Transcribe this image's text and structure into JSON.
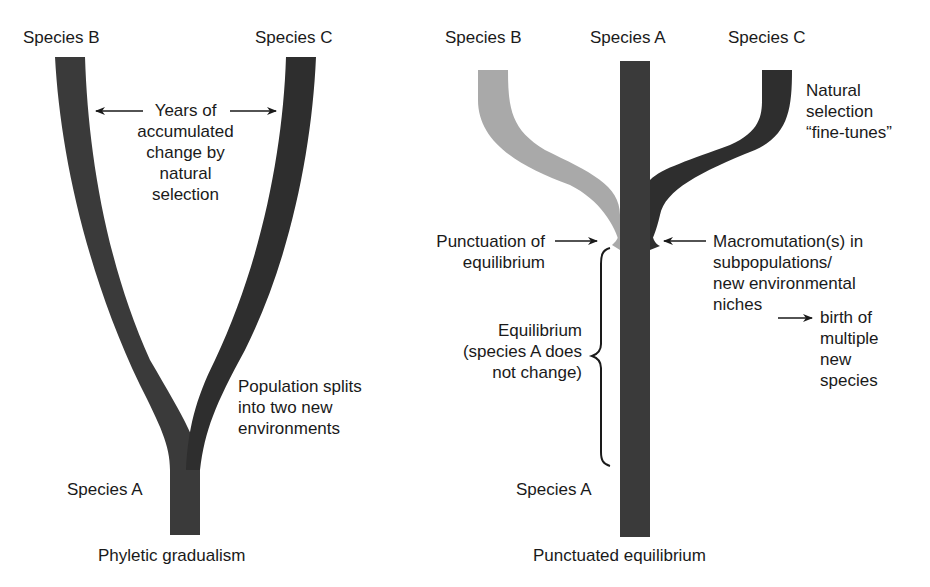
{
  "colors": {
    "dark_branch": "#3a3a3a",
    "darker_branch": "#2e2e2e",
    "light_branch": "#a9a9a9",
    "text": "#1a1a1a",
    "background": "#ffffff"
  },
  "left_panel": {
    "title": "Phyletic gradualism",
    "species_b": "Species B",
    "species_c": "Species C",
    "species_a": "Species A",
    "years_note": [
      "Years of",
      "accumulated",
      "change by",
      "natural",
      "selection"
    ],
    "split_note": [
      "Population splits",
      "into two new",
      "environments"
    ]
  },
  "right_panel": {
    "title": "Punctuated equilibrium",
    "species_b": "Species B",
    "species_a_top": "Species A",
    "species_c": "Species C",
    "species_a_bottom": "Species A",
    "fine_tune_note": [
      "Natural",
      "selection",
      "“fine-tunes”"
    ],
    "punctuation_note": [
      "Punctuation of",
      "equilibrium"
    ],
    "equilibrium_note": [
      "Equilibrium",
      "(species A does",
      "not change)"
    ],
    "macromutation_note": [
      "Macromutation(s) in",
      "subpopulations/",
      "new environmental",
      "niches"
    ],
    "birth_note": [
      "birth of",
      "multiple",
      "new",
      "species"
    ]
  }
}
